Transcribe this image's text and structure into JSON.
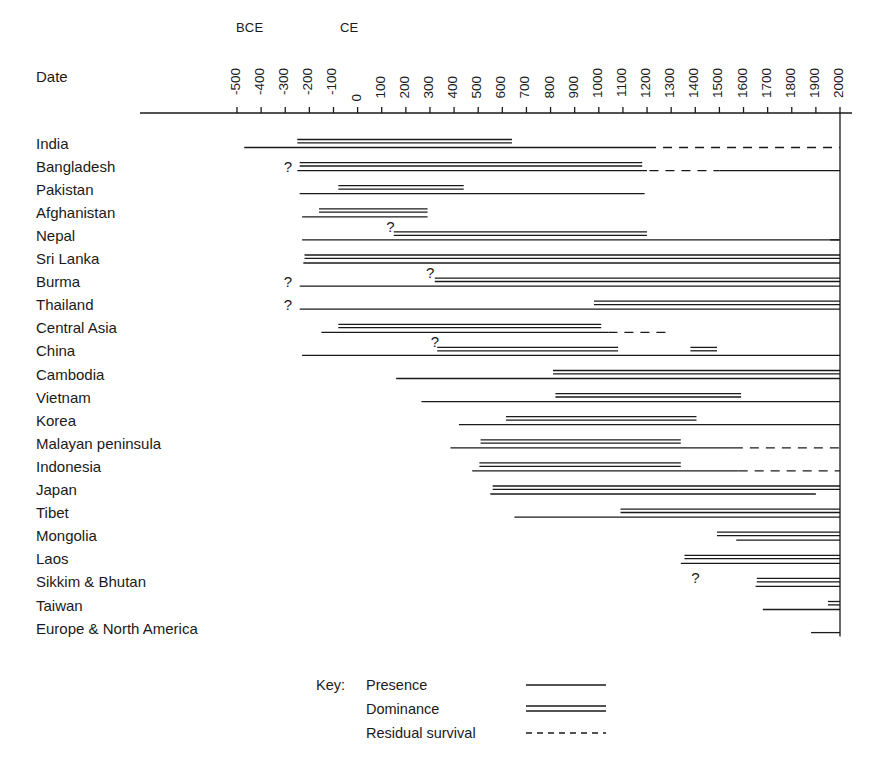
{
  "axis": {
    "date_label": "Date",
    "era_bce": "BCE",
    "era_ce": "CE",
    "ticks": [
      "-500",
      "-400",
      "-300",
      "-200",
      "-100",
      "0",
      "100",
      "200",
      "300",
      "400",
      "500",
      "600",
      "700",
      "800",
      "900",
      "1000",
      "1100",
      "1200",
      "1300",
      "1400",
      "1500",
      "1600",
      "1700",
      "1800",
      "1900",
      "2000"
    ],
    "x_min": -500,
    "x_max": 2000
  },
  "legend": {
    "key_label": "Key:",
    "items": [
      {
        "label": "Presence",
        "style": "presence"
      },
      {
        "label": "Dominance",
        "style": "dominance"
      },
      {
        "label": "Residual survival",
        "style": "residual"
      }
    ]
  },
  "colors": {
    "ink": "#1a1a1a",
    "background": "#ffffff"
  },
  "chart_data": {
    "type": "timeline",
    "xlabel": "Date",
    "xlim": [
      -500,
      2000
    ],
    "grid": false,
    "legend_position": "bottom",
    "series_styles": [
      "presence",
      "dominance",
      "residual"
    ],
    "categories": [
      "India",
      "Bangladesh",
      "Pakistan",
      "Afghanistan",
      "Nepal",
      "Sri Lanka",
      "Burma",
      "Thailand",
      "Central Asia",
      "China",
      "Cambodia",
      "Vietnam",
      "Korea",
      "Malayan peninsula",
      "Indonesia",
      "Japan",
      "Tibet",
      "Mongolia",
      "Laos",
      "Sikkim & Bhutan",
      "Taiwan",
      "Europe & North America"
    ],
    "rows": [
      {
        "region": "India",
        "presence": [
          [
            -470,
            1200
          ]
        ],
        "dominance": [
          [
            -250,
            640
          ]
        ],
        "residual": [
          [
            1200,
            2000
          ]
        ],
        "queries": []
      },
      {
        "region": "Bangladesh",
        "presence": [
          [
            -250,
            1200
          ]
        ],
        "dominance": [
          [
            -240,
            1180
          ]
        ],
        "residual": [
          [
            1210,
            1500
          ]
        ],
        "queries": [
          -290
        ],
        "late_presence": [
          [
            1500,
            2000
          ]
        ]
      },
      {
        "region": "Pakistan",
        "presence": [
          [
            -240,
            1190
          ]
        ],
        "dominance": [
          [
            -80,
            440
          ]
        ],
        "residual": [],
        "queries": []
      },
      {
        "region": "Afghanistan",
        "presence": [
          [
            -230,
            290
          ]
        ],
        "dominance": [
          [
            -160,
            290
          ]
        ],
        "residual": [],
        "queries": []
      },
      {
        "region": "Nepal",
        "presence": [
          [
            -230,
            2000
          ]
        ],
        "dominance": [
          [
            150,
            1200
          ]
        ],
        "residual": [
          [
            1960,
            2000
          ]
        ],
        "queries": [
          135
        ]
      },
      {
        "region": "Sri Lanka",
        "presence": [
          [
            -225,
            2000
          ]
        ],
        "dominance": [
          [
            -220,
            2000
          ]
        ],
        "residual": [],
        "queries": []
      },
      {
        "region": "Burma",
        "presence": [
          [
            -240,
            2000
          ]
        ],
        "dominance": [
          [
            320,
            2000
          ]
        ],
        "residual": [],
        "queries": [
          -290,
          300
        ]
      },
      {
        "region": "Thailand",
        "presence": [
          [
            -240,
            2000
          ]
        ],
        "dominance": [
          [
            980,
            2000
          ]
        ],
        "residual": [],
        "queries": [
          -290
        ]
      },
      {
        "region": "Central Asia",
        "presence": [
          [
            -150,
            1040
          ]
        ],
        "dominance": [
          [
            -80,
            1010
          ]
        ],
        "residual": [
          [
            1040,
            1300
          ]
        ],
        "queries": []
      },
      {
        "region": "China",
        "presence": [
          [
            -230,
            2000
          ]
        ],
        "dominance": [
          [
            330,
            1080
          ],
          [
            1380,
            1490
          ]
        ],
        "residual": [],
        "queries": [
          320
        ]
      },
      {
        "region": "Cambodia",
        "presence": [
          [
            160,
            2000
          ]
        ],
        "dominance": [
          [
            810,
            2000
          ]
        ],
        "residual": [],
        "queries": []
      },
      {
        "region": "Vietnam",
        "presence": [
          [
            265,
            2000
          ]
        ],
        "dominance": [
          [
            820,
            1590
          ]
        ],
        "residual": [],
        "queries": []
      },
      {
        "region": "Korea",
        "presence": [
          [
            420,
            2000
          ]
        ],
        "dominance": [
          [
            615,
            1405
          ]
        ],
        "residual": [],
        "queries": []
      },
      {
        "region": "Malayan peninsula",
        "presence": [
          [
            385,
            1560
          ]
        ],
        "dominance": [
          [
            510,
            1340
          ]
        ],
        "residual": [
          [
            1560,
            2000
          ]
        ],
        "queries": []
      },
      {
        "region": "Indonesia",
        "presence": [
          [
            475,
            1580
          ]
        ],
        "dominance": [
          [
            505,
            1340
          ]
        ],
        "residual": [
          [
            1580,
            2000
          ]
        ],
        "queries": []
      },
      {
        "region": "Japan",
        "presence": [
          [
            550,
            1900
          ]
        ],
        "dominance": [
          [
            560,
            2000
          ]
        ],
        "residual": [],
        "queries": []
      },
      {
        "region": "Tibet",
        "presence": [
          [
            650,
            2000
          ]
        ],
        "dominance": [
          [
            1090,
            2000
          ]
        ],
        "residual": [],
        "queries": []
      },
      {
        "region": "Mongolia",
        "presence": [
          [
            1570,
            2000
          ]
        ],
        "dominance": [
          [
            1490,
            2000
          ]
        ],
        "residual": [],
        "queries": []
      },
      {
        "region": "Laos",
        "presence": [
          [
            1340,
            2000
          ]
        ],
        "dominance": [
          [
            1355,
            2000
          ]
        ],
        "residual": [],
        "queries": []
      },
      {
        "region": "Sikkim & Bhutan",
        "presence": [
          [
            1650,
            2000
          ]
        ],
        "dominance": [
          [
            1655,
            2000
          ]
        ],
        "residual": [],
        "queries": [
          1400
        ]
      },
      {
        "region": "Taiwan",
        "presence": [
          [
            1680,
            2000
          ]
        ],
        "dominance": [
          [
            1950,
            2000
          ]
        ],
        "residual": [],
        "queries": []
      },
      {
        "region": "Europe & North America",
        "presence": [
          [
            1880,
            2000
          ]
        ],
        "dominance": [],
        "residual": [],
        "queries": []
      }
    ]
  }
}
